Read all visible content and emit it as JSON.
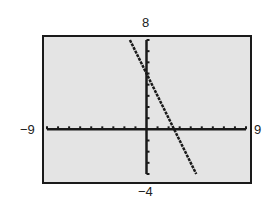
{
  "chart_data": {
    "type": "line",
    "title": "",
    "xlabel": "",
    "ylabel": "",
    "xlim": [
      -9,
      9
    ],
    "ylim": [
      -4,
      8
    ],
    "xscale": 1,
    "yscale": 1,
    "grid": false,
    "window_labels": {
      "xmin": "−9",
      "xmax": "9",
      "ymin": "−4",
      "ymax": "8"
    },
    "series": [
      {
        "name": "y = -2x + 5",
        "x": [
          -1.5,
          4.5
        ],
        "y": [
          8,
          -4
        ]
      }
    ],
    "y_intercept": 5,
    "x_intercept": 2.5
  },
  "colors": {
    "background": "#e4e4e4",
    "axis": "#1a1a1a",
    "line": "#1a1a1a"
  }
}
